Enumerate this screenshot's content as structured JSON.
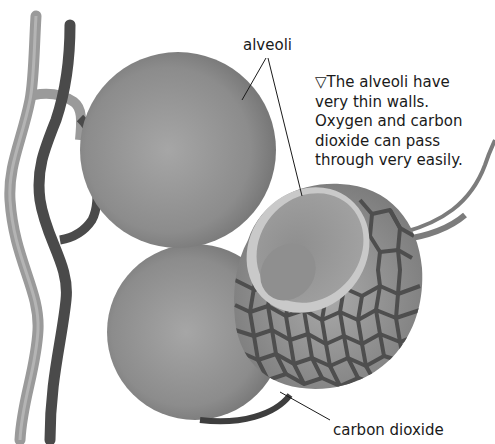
{
  "diagram": {
    "subject": "alveoli",
    "labels": {
      "alveoli": "alveoli",
      "carbon_dioxide": "carbon dioxide"
    },
    "caption": {
      "marker": "▽",
      "lines": [
        "The alveoli have",
        "very thin walls.",
        "Oxygen and carbon",
        "dioxide can pass",
        "through very easily."
      ]
    },
    "parts": [
      "blood-vessel-light",
      "blood-vessel-dark",
      "alveolus-upper",
      "alveolus-lower",
      "alveolus-cutaway-with-capillary-network",
      "vessel-right"
    ],
    "colors": {
      "background": "#ffffff",
      "sphere": "#8a8a8a",
      "sphere_highlight": "#a8a8a8",
      "vessel_light": "#9a9a9a",
      "vessel_dark": "#4a4a4a",
      "capillary_net": "#4e4e4e",
      "rim": "#c8c8c8",
      "text": "#1a1a1a"
    }
  }
}
